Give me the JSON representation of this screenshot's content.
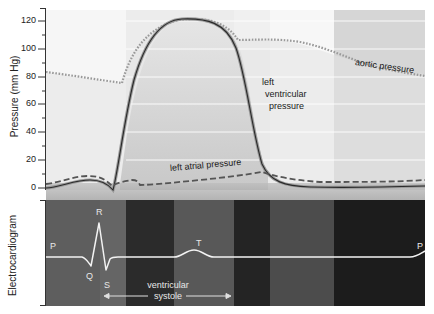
{
  "diagram": {
    "top_panel": {
      "y_axis_label": "Pressure (mm Hg)",
      "y_ticks": [
        "0",
        "20",
        "40",
        "60",
        "80",
        "100",
        "120"
      ],
      "y_range": [
        0,
        125
      ],
      "curve_labels": {
        "aortic": "aortic pressure",
        "left_ventricular_line1": "left",
        "left_ventricular_line2": "ventricular",
        "left_ventricular_line3": "pressure",
        "left_atrial": "left atrial pressure"
      },
      "colors": {
        "background_light": "#f4f4f4",
        "band_medium": "#d4d4d4",
        "band_light": "#ececec",
        "lv_curve": "#333333",
        "aortic_curve": "#9a9a9a",
        "atrial_curve": "#555555"
      }
    },
    "bottom_panel": {
      "y_axis_label": "Electrocardiogram",
      "wave_labels": {
        "p_start": "P",
        "q": "Q",
        "r": "R",
        "s": "S",
        "t": "T",
        "p_end": "P"
      },
      "annotation_line1": "ventricular",
      "annotation_line2": "systole",
      "colors": {
        "band_gray": "#5c5c5c",
        "band_dark": "#2a2a2a",
        "band_darker": "#1c1c1c",
        "trace": "#f2f2f2"
      }
    }
  }
}
